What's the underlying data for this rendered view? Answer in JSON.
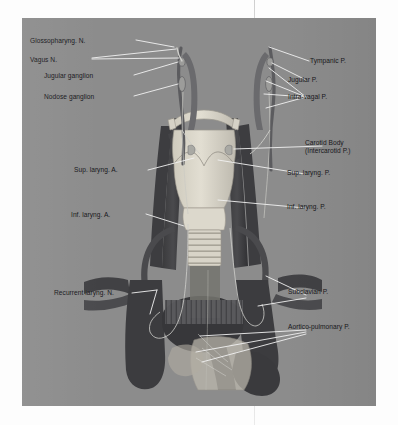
{
  "figure": {
    "panel_color": "#8c8c8c",
    "page_color": "#fdfdfd",
    "leader_line_color": "#f2f2f2",
    "label_color": "#16161a",
    "labels_left": [
      {
        "id": "glossopharyngeal-nerve",
        "text": "Glossopharyng. N.",
        "x": 30,
        "y": 37
      },
      {
        "id": "vagus-nerve",
        "text": "Vagus N.",
        "x": 30,
        "y": 56
      },
      {
        "id": "jugular-ganglion",
        "text": "Jugular ganglion",
        "x": 44,
        "y": 72
      },
      {
        "id": "nodose-ganglion",
        "text": "Nodose ganglion",
        "x": 44,
        "y": 93
      },
      {
        "id": "superior-laryngeal-artery",
        "text": "Sup. laryng. A.",
        "x": 74,
        "y": 166
      },
      {
        "id": "inferior-laryngeal-artery",
        "text": "Inf. laryng. A.",
        "x": 71,
        "y": 211
      },
      {
        "id": "recurrent-laryngeal-nerve",
        "text": "Recurrent laryng. N.",
        "x": 54,
        "y": 289
      }
    ],
    "labels_right": [
      {
        "id": "tympanic-plexus",
        "text": "Tympanic P.",
        "x": 310,
        "y": 57
      },
      {
        "id": "jugular-plexus",
        "text": "Jugular P.",
        "x": 288,
        "y": 78
      },
      {
        "id": "intra-vagal-plexus",
        "text": "Intra-vagal P.",
        "x": 288,
        "y": 95
      },
      {
        "id": "carotid-body-line1",
        "text": "Carotid Body",
        "x": 305,
        "y": 139
      },
      {
        "id": "carotid-body-line2",
        "text": "(Intercarotid P.)",
        "x": 305,
        "y": 147
      },
      {
        "id": "superior-laryngeal-plexus",
        "text": "Sup. laryng. P.",
        "x": 287,
        "y": 169
      },
      {
        "id": "inferior-laryngeal-plexus",
        "text": "Inf. laryng. P.",
        "x": 287,
        "y": 203
      },
      {
        "id": "subclavian-plexus",
        "text": "Subclavian P.",
        "x": 288,
        "y": 288
      },
      {
        "id": "aortico-pulmonary-plexus",
        "text": "Aortico-pulmonary P.",
        "x": 288,
        "y": 323
      }
    ]
  }
}
